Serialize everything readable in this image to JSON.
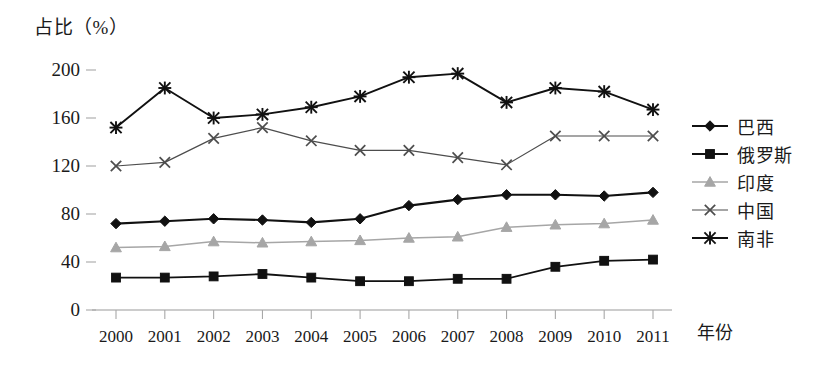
{
  "chart_data": {
    "type": "line",
    "title": "",
    "ylabel": "占比（%）",
    "xlabel": "年份",
    "categories": [
      "2000",
      "2001",
      "2002",
      "2003",
      "2004",
      "2005",
      "2006",
      "2007",
      "2008",
      "2009",
      "2010",
      "2011"
    ],
    "ylim": [
      0,
      210
    ],
    "yticks": [
      0,
      40,
      80,
      120,
      160,
      200
    ],
    "grid": false,
    "legend_position": "right",
    "series": [
      {
        "name": "巴西",
        "marker": "diamond",
        "color": "#111111",
        "values": [
          72,
          74,
          76,
          75,
          73,
          76,
          87,
          92,
          96,
          96,
          95,
          98
        ]
      },
      {
        "name": "俄罗斯",
        "marker": "square",
        "color": "#111111",
        "values": [
          27,
          27,
          28,
          30,
          27,
          24,
          24,
          26,
          26,
          36,
          41,
          42
        ]
      },
      {
        "name": "印度",
        "marker": "triangle",
        "color": "#a6a6a6",
        "values": [
          52,
          53,
          57,
          56,
          57,
          58,
          60,
          61,
          69,
          71,
          72,
          75
        ]
      },
      {
        "name": "中国",
        "marker": "x",
        "color": "#4d4d4d",
        "values": [
          120,
          123,
          143,
          152,
          141,
          133,
          133,
          127,
          121,
          145,
          145,
          145
        ]
      },
      {
        "name": "南非",
        "marker": "asterisk",
        "color": "#111111",
        "values": [
          152,
          185,
          160,
          163,
          169,
          178,
          194,
          197,
          173,
          185,
          182,
          167
        ]
      }
    ]
  }
}
